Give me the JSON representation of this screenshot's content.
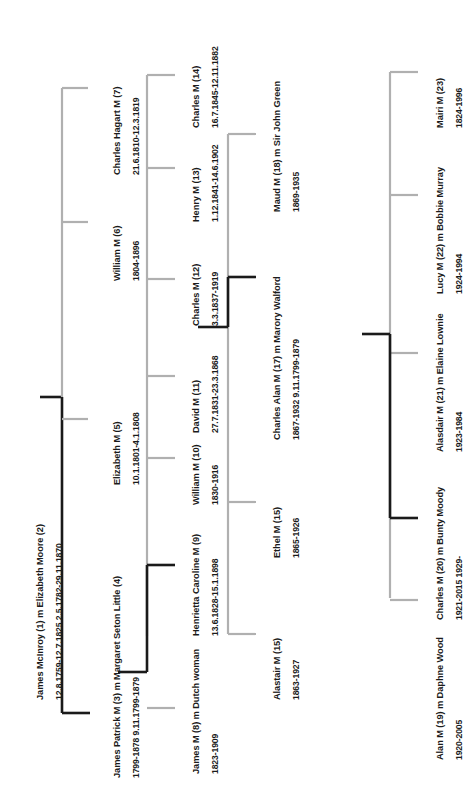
{
  "colors": {
    "line_black": "#1a1a1a",
    "line_grey": "#b0b0b0",
    "text": "#1b1b1b",
    "background": "#ffffff"
  },
  "generations": [
    {
      "id": "gen-1",
      "people": [
        {
          "id": "p1",
          "name": "James McInroy (1)  m  Elizabeth Moore (2)",
          "dates": "12.8.1759-12.7.1825                  2.5.1782-29.11.1870"
        }
      ]
    },
    {
      "id": "gen-2",
      "people": [
        {
          "id": "p3",
          "name": "James Patrick M (3)  m  Margaret Seton Little (4)",
          "dates": "1799-1878                        9.11.1799-1879"
        },
        {
          "id": "p5",
          "name": "Elizabeth M (5)",
          "dates": "10.1.1801-4.1.1808"
        },
        {
          "id": "p6",
          "name": "William M (6)",
          "dates": "1804-1896"
        },
        {
          "id": "p7",
          "name": "Charles Hagart M (7)",
          "dates": "21.6.1810-12.3.1819"
        }
      ]
    },
    {
      "id": "gen-3",
      "people": [
        {
          "id": "p8",
          "name": "James M (8) m Dutch woman",
          "dates": "1823-1909"
        },
        {
          "id": "p9",
          "name": "Henrietta Caroline M (9)",
          "dates": "13.6.1828-15.1.1898"
        },
        {
          "id": "p10",
          "name": "William M (10)",
          "dates": "1830-1916"
        },
        {
          "id": "p11",
          "name": "David M (11)",
          "dates": "27.7.1831-23.3.1868"
        },
        {
          "id": "p12",
          "name": "Charles M (12)",
          "dates": "3.3.1837-1919"
        },
        {
          "id": "p13",
          "name": "Henry M (13)",
          "dates": "1.12.1841-14.6.1902"
        },
        {
          "id": "p14",
          "name": "Charles M (14)",
          "dates": "16.7.1845-12.11.1882"
        }
      ]
    },
    {
      "id": "gen-4",
      "people": [
        {
          "id": "p15a",
          "name": "Alastair M (15)",
          "dates": "1863-1927"
        },
        {
          "id": "p15b",
          "name": "Ethel M (15)",
          "dates": "1865-1926"
        },
        {
          "id": "p17",
          "name": "Charles Alan M (17) m Marory Walford",
          "dates": "1867-1932                 9.11.1799-1879"
        },
        {
          "id": "p18",
          "name": "Maud M (18) m Sir John Green",
          "dates": "1869-1935"
        }
      ]
    },
    {
      "id": "gen-5",
      "people": [
        {
          "id": "p19",
          "name": "Alan M (19) m Daphne Wood",
          "dates": "1920-2005"
        },
        {
          "id": "p20",
          "name": "Charles M (20) m Bunty Moody",
          "dates": "1921-2015                  1929-"
        },
        {
          "id": "p21",
          "name": "Alasdair M (21) m Elaine Lownie",
          "dates": "1923-1984"
        },
        {
          "id": "p22",
          "name": "Lucy M (22) m Bobbie Murray",
          "dates": "1924-1994"
        },
        {
          "id": "p23",
          "name": "Mairi M (23)",
          "dates": "1824-1996"
        }
      ]
    }
  ]
}
